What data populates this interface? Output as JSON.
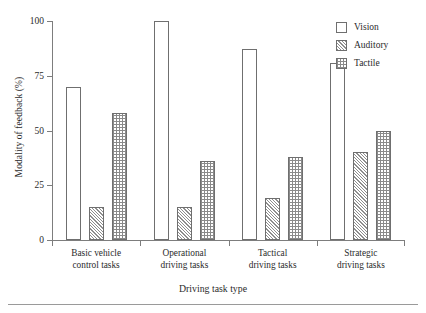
{
  "chart_data": {
    "type": "bar",
    "title": "",
    "xlabel": "Driving task type",
    "ylabel": "Modality of feedback (%)",
    "categories": [
      "Basic vehicle control tasks",
      "Operational driving tasks",
      "Tactical driving tasks",
      "Strategic driving tasks"
    ],
    "category_lines": [
      [
        "Basic vehicle",
        "control tasks"
      ],
      [
        "Operational",
        "driving tasks"
      ],
      [
        "Tactical",
        "driving tasks"
      ],
      [
        "Strategic",
        "driving tasks"
      ]
    ],
    "series": [
      {
        "name": "Vision",
        "pattern": "solid-white",
        "values": [
          70,
          100,
          87,
          81
        ]
      },
      {
        "name": "Auditory",
        "pattern": "diagonal-hatch",
        "values": [
          15,
          15,
          19,
          40
        ]
      },
      {
        "name": "Tactile",
        "pattern": "dotted-grid",
        "values": [
          58,
          36,
          38,
          50
        ]
      }
    ],
    "ylim": [
      0,
      100
    ],
    "yticks": [
      0,
      25,
      50,
      75,
      100
    ],
    "ytick_labels": [
      "0",
      "25",
      "50",
      "75",
      "100"
    ],
    "grid": false,
    "legend_position": "top-right",
    "legend_entries": [
      "Vision",
      "Auditory",
      "Tactile"
    ],
    "colors": {
      "axis": "#7d7d7d",
      "bar_outline": "#6f6f6f",
      "hatch": "#8e8e8e",
      "text": "#2b2b2b",
      "background": "#ffffff"
    }
  }
}
